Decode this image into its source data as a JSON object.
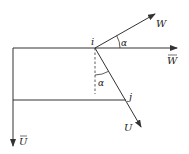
{
  "diagram": {
    "type": "vector-decomposition",
    "colors": {
      "stroke": "#333333",
      "background": "#ffffff"
    },
    "labels": {
      "point_i": "i",
      "point_j": "j",
      "vector_W": "W",
      "vector_W_bar": "W",
      "vector_U": "U",
      "vector_U_bar": "U",
      "angle_top": "α",
      "angle_bottom": "α"
    },
    "elements": [
      {
        "name": "W-bar axis",
        "kind": "arrow",
        "from": [
          13,
          48
        ],
        "to": [
          177,
          48
        ]
      },
      {
        "name": "U-bar axis",
        "kind": "arrow",
        "from": [
          13,
          48
        ],
        "to": [
          13,
          146
        ]
      },
      {
        "name": "lower horizontal",
        "kind": "line",
        "from": [
          13,
          100
        ],
        "to": [
          125,
          100
        ]
      },
      {
        "name": "W vector",
        "kind": "arrow",
        "from": [
          95,
          48
        ],
        "to": [
          155,
          14
        ]
      },
      {
        "name": "U vector",
        "kind": "arrow",
        "from": [
          95,
          48
        ],
        "to": [
          141,
          127
        ]
      },
      {
        "name": "vertical reference",
        "kind": "dashed-line",
        "from": [
          95,
          48
        ],
        "to": [
          95,
          94
        ]
      }
    ]
  }
}
